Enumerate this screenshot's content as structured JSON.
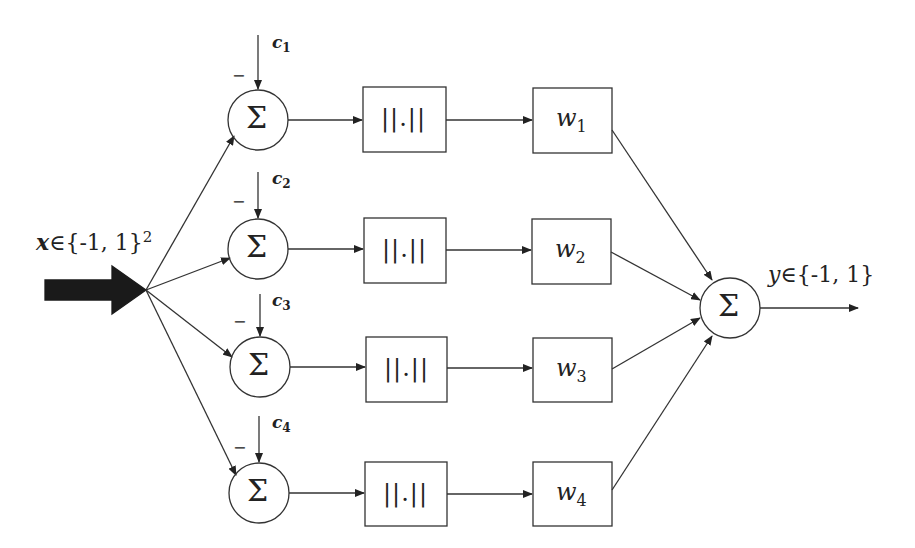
{
  "diagram": {
    "input_label": {
      "var": "x",
      "set": "∈{-1, 1}",
      "exp": "2"
    },
    "output_label": {
      "var": "y",
      "set": "∈{-1, 1}"
    },
    "minus_sign": "−",
    "sum_symbol": "Σ",
    "norm_symbol": "||.||",
    "rows": [
      {
        "c_label": "c",
        "c_index": "1",
        "w_label": "w",
        "w_index": "1"
      },
      {
        "c_label": "c",
        "c_index": "2",
        "w_label": "w",
        "w_index": "2"
      },
      {
        "c_label": "c",
        "c_index": "3",
        "w_label": "w",
        "w_index": "3"
      },
      {
        "c_label": "c",
        "c_index": "4",
        "w_label": "w",
        "w_index": "4"
      }
    ],
    "output_sum_symbol": "Σ"
  }
}
